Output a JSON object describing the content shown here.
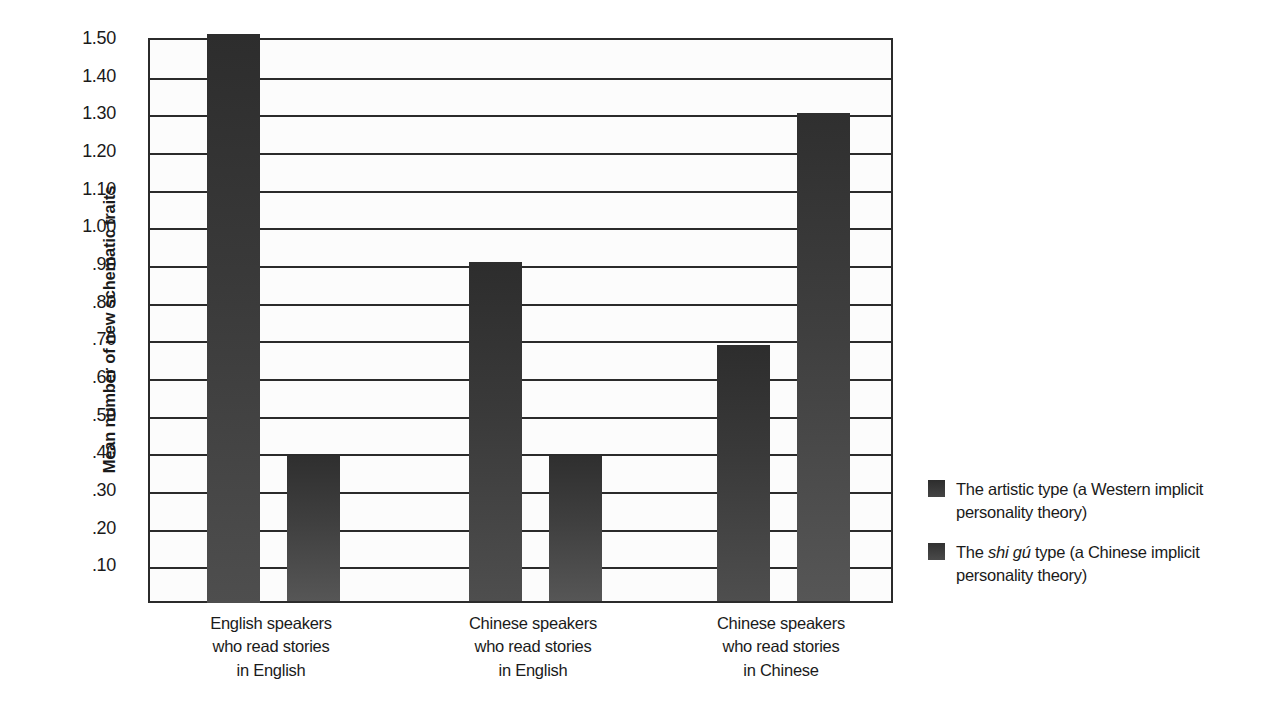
{
  "chart_data": {
    "type": "bar",
    "title": "",
    "xlabel": "",
    "ylabel": "Mean number of new schematic traits",
    "ylim": [
      0,
      1.5
    ],
    "grid": true,
    "legend_position": "right",
    "categories": [
      "English speakers who read stories in English",
      "Chinese speakers who read stories in English",
      "Chinese speakers who read stories in Chinese"
    ],
    "category_lines": [
      [
        "English speakers",
        "who read stories",
        "in English"
      ],
      [
        "Chinese speakers",
        "who read stories",
        "in English"
      ],
      [
        "Chinese speakers",
        "who read stories",
        "in Chinese"
      ]
    ],
    "series": [
      {
        "name": "The artistic type (a Western implicit personality theory)",
        "values": [
          1.5,
          0.9,
          0.68
        ]
      },
      {
        "name": "The shi gú type (a Chinese implicit personality theory)",
        "values": [
          0.385,
          0.385,
          1.295
        ]
      }
    ],
    "ytick_values": [
      1.5,
      1.4,
      1.3,
      1.2,
      1.1,
      1.0,
      0.9,
      0.8,
      0.7,
      0.6,
      0.5,
      0.4,
      0.3,
      0.2,
      0.1
    ],
    "ytick_labels": [
      "1.50",
      "1.40",
      "1.30",
      "1.20",
      "1.10",
      "1.00",
      ".90",
      ".80",
      ".70",
      ".60",
      ".50",
      ".40",
      ".30",
      ".20",
      ".10"
    ],
    "colors": {
      "series_0": "#3a3a3a",
      "series_1": "#3f3f3f",
      "axis": "#2b2b2b",
      "background": "#ffffff",
      "text": "#1a1a1a"
    }
  },
  "legend": {
    "entries": [
      {
        "prefix": "The artistic type (a Western implicit",
        "emphasis": "",
        "suffix": "",
        "line2": "personality theory)"
      },
      {
        "prefix": "The ",
        "emphasis": "shi gú",
        "suffix": " type (a Chinese implicit",
        "line2": "personality theory)"
      }
    ]
  }
}
